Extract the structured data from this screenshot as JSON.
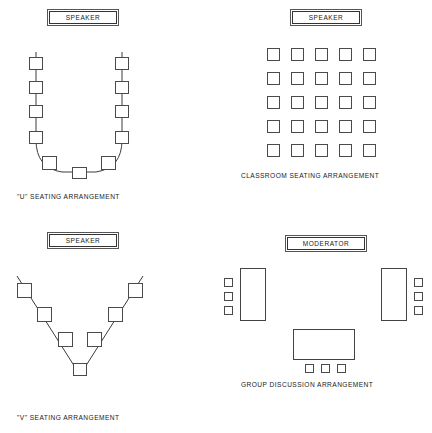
{
  "page": {
    "background_color": "#ffffff",
    "line_color": "#3c3c3c"
  },
  "panels": [
    {
      "id": "u-arrangement",
      "plaque_label": "SPEAKER",
      "caption": "\"U\" SEATING ARRANGEMENT",
      "seat_count": 11,
      "description": "U-shaped seating with four seats per side arm, one seat at each curve, and one at the base"
    },
    {
      "id": "classroom-arrangement",
      "plaque_label": "SPEAKER",
      "caption": "CLASSROOM SEATING ARRANGEMENT",
      "rows": 5,
      "columns": 5,
      "seat_count": 25,
      "description": "Grid of desks in five rows of five facing the speaker"
    },
    {
      "id": "v-arrangement",
      "plaque_label": "SPEAKER",
      "caption": "\"V\" SEATING ARRANGEMENT",
      "seat_count": 7,
      "description": "V-shaped seating with three seats per arm and one at the vertex"
    },
    {
      "id": "group-discussion-arrangement",
      "plaque_label": "MODERATOR",
      "caption": "GROUP DISCUSSION ARRANGEMENT",
      "table_count": 3,
      "seat_count": 9,
      "description": "Three tables arranged in a U with three chairs at each table"
    }
  ],
  "u_layout": {
    "left_seats_y": [
      62,
      86,
      110,
      134
    ],
    "right_seats_y": [
      62,
      86,
      110,
      134
    ],
    "left_x": 36,
    "right_x": 122,
    "corner_seats": [
      {
        "x": 50,
        "y": 152
      },
      {
        "x": 108,
        "y": 152
      }
    ],
    "bottom_seat": {
      "x": 79,
      "y": 166
    }
  },
  "classroom_layout": {
    "start_x": 267,
    "start_y": 48,
    "step_x": 24,
    "step_y": 24,
    "seat_size": 13
  },
  "v_layout": {
    "left_seats": [
      {
        "x": 24,
        "y": 291
      },
      {
        "x": 44,
        "y": 316
      },
      {
        "x": 65,
        "y": 340
      }
    ],
    "right_seats": [
      {
        "x": 122,
        "y": 291
      },
      {
        "x": 102,
        "y": 316
      },
      {
        "x": 82,
        "y": 340
      }
    ],
    "vertex_seat": {
      "x": 73,
      "y": 371
    }
  },
  "group_layout": {
    "left_table": {
      "x": 240,
      "y": 268,
      "w": 26,
      "h": 53
    },
    "right_table": {
      "x": 381,
      "y": 268,
      "w": 26,
      "h": 53
    },
    "bottom_table": {
      "x": 293,
      "y": 329,
      "w": 62,
      "h": 31
    },
    "left_chairs_y": [
      278,
      292,
      306
    ],
    "right_chairs_y": [
      278,
      292,
      306
    ],
    "bottom_chairs_x": [
      305,
      321,
      337
    ]
  }
}
